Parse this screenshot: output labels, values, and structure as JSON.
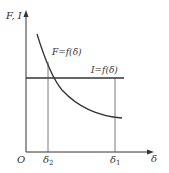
{
  "diagram": {
    "axes": {
      "y_label": "F, I",
      "x_label": "δ",
      "origin_label": "O"
    },
    "curves": [
      {
        "name": "F-curve",
        "label": "F=f(δ)",
        "shape": "decreasing hyperbola-like"
      },
      {
        "name": "I-line",
        "label": "I=f(δ)",
        "shape": "horizontal line"
      }
    ],
    "x_ticks": [
      {
        "symbol": "δ",
        "sub": "2"
      },
      {
        "symbol": "δ",
        "sub": "1"
      }
    ],
    "colors": {
      "line": "#333333",
      "background": "#ffffff"
    }
  }
}
